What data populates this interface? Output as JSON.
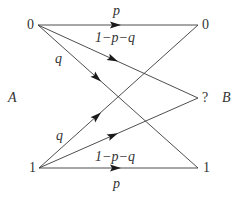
{
  "diagram": {
    "type": "binary-erasure-error-channel",
    "input_side_label": "A",
    "output_side_label": "B",
    "input_nodes": [
      {
        "id": "in0",
        "label": "0",
        "x": 38,
        "y": 25
      },
      {
        "id": "in1",
        "label": "1",
        "x": 39,
        "y": 168
      }
    ],
    "output_nodes": [
      {
        "id": "out0",
        "label": "0",
        "x": 198,
        "y": 25
      },
      {
        "id": "outQ",
        "label": "?",
        "x": 198,
        "y": 98
      },
      {
        "id": "out1",
        "label": "1",
        "x": 198,
        "y": 168
      }
    ],
    "edges": [
      {
        "from": "in0",
        "to": "out0",
        "label": "p"
      },
      {
        "from": "in0",
        "to": "outQ",
        "label": "1−p−q"
      },
      {
        "from": "in0",
        "to": "out1",
        "label": "q"
      },
      {
        "from": "in1",
        "to": "out1",
        "label": "p"
      },
      {
        "from": "in1",
        "to": "outQ",
        "label": "1−p−q"
      },
      {
        "from": "in1",
        "to": "out0",
        "label": "q"
      }
    ],
    "labels": {
      "A": "A",
      "B": "B",
      "in0": "0",
      "in1": "1",
      "out0": "0",
      "outQ": "?",
      "out1": "1",
      "p_top": "p",
      "erase_top": "1−p−q",
      "q_top": "q",
      "q_bottom": "q",
      "erase_bottom": "1−p−q",
      "p_bottom": "p"
    },
    "colors": {
      "line": "#3a3a3a",
      "arrow": "#1a1a1a",
      "text": "#333333",
      "background": "#ffffff"
    }
  }
}
